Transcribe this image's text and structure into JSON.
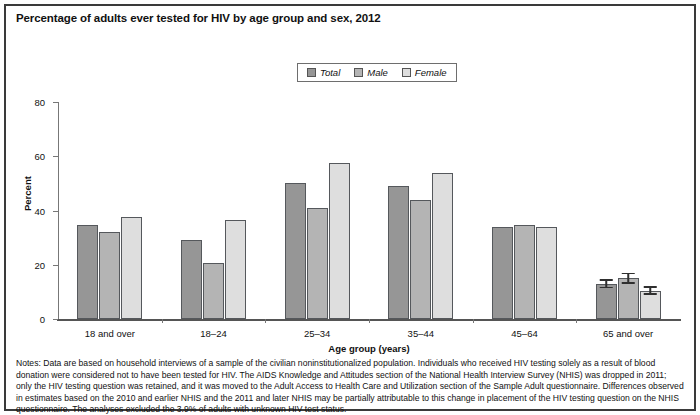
{
  "chart_data": {
    "type": "bar",
    "title": "Percentage of adults ever tested for HIV by age group and sex, 2012",
    "xlabel": "Age group (years)",
    "ylabel": "Percent",
    "ylim": [
      0,
      80
    ],
    "yticks": [
      0,
      20,
      40,
      60,
      80
    ],
    "grid": false,
    "legend_position": "top-center",
    "categories": [
      "18 and over",
      "18–24",
      "25–34",
      "35–44",
      "45–64",
      "65 and over"
    ],
    "series": [
      {
        "name": "Total",
        "color": "#969696",
        "values": [
          34.5,
          29.0,
          50.0,
          49.0,
          34.0,
          13.0
        ],
        "errors": [
          null,
          null,
          null,
          null,
          null,
          1.6
        ]
      },
      {
        "name": "Male",
        "color": "#b4b4b4",
        "values": [
          32.0,
          20.5,
          41.0,
          44.0,
          34.5,
          15.0
        ],
        "errors": [
          null,
          null,
          null,
          null,
          null,
          2.0
        ]
      },
      {
        "name": "Female",
        "color": "#dedede",
        "values": [
          37.5,
          36.5,
          57.5,
          54.0,
          34.0,
          10.5
        ],
        "errors": [
          null,
          null,
          null,
          null,
          null,
          1.6
        ]
      }
    ],
    "notes_label": "Notes:",
    "notes": "Data are based on household interviews of a sample of the civilian noninstitutionalized population. Individuals who received HIV testing solely as a result of blood donation were considered not to have been tested for HIV. The AIDS Knowledge and Attitudes section of the National Health Interview Survey (NHIS) was dropped in 2011; only the HIV testing question was retained, and it was moved to the Adult Access to Health Care and Utilization section of the Sample Adult questionnaire. Differences observed in estimates based on the 2010 and earlier NHIS and the 2011 and later NHIS may be partially attributable to this change in placement of the HIV testing question on the NHIS questionnaire. The analyses excluded the 3.9% of adults with unknown HIV test status."
  }
}
